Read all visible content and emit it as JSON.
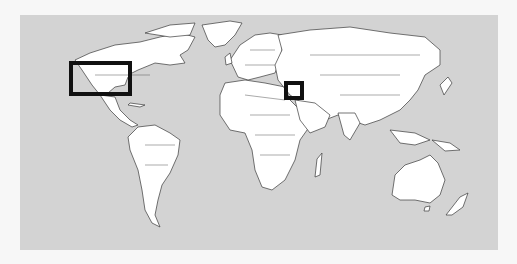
{
  "map": {
    "type": "world-political-outline",
    "colors": {
      "page_background": "#f7f7f7",
      "ocean": "#d3d3d3",
      "land": "#ffffff",
      "borders": "#3a3a3a",
      "highlight_box": "#111111"
    },
    "highlight_regions": [
      {
        "name": "northern-united-states-region",
        "left": 69,
        "top": 61,
        "width": 63,
        "height": 35
      },
      {
        "name": "middle-east-levant-region",
        "left": 284,
        "top": 81,
        "width": 20,
        "height": 19
      }
    ]
  }
}
